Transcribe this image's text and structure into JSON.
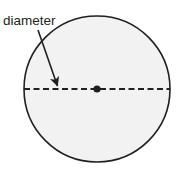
{
  "figure": {
    "kind": "geometry-diagram",
    "background_color": "#ffffff",
    "labels": {
      "diameter": "diameter"
    },
    "colors": {
      "circle_stroke": "#231f20",
      "circle_fill": "#f2f2f2",
      "dashed_line": "#231f20",
      "center_dot": "#231f20",
      "arrow": "#231f20",
      "text": "#231f20"
    },
    "circle": {
      "center_x": 97,
      "center_y": 89,
      "radius": 73,
      "stroke_width": 1.6
    },
    "diameter_line": {
      "x1": 24,
      "y1": 89,
      "x2": 170,
      "y2": 89,
      "dash_length": 6,
      "gap_length": 3.5,
      "stroke_width": 1.8
    },
    "center_point": {
      "x": 97,
      "y": 89,
      "radius": 3.6
    },
    "annotation_arrow": {
      "start_x": 38,
      "start_y": 30,
      "end_x": 58,
      "end_y": 87,
      "stroke_width": 1.6,
      "arrowhead_size": 7
    },
    "label_position": {
      "x": 3,
      "y": 25,
      "font_size": 13.5
    }
  }
}
